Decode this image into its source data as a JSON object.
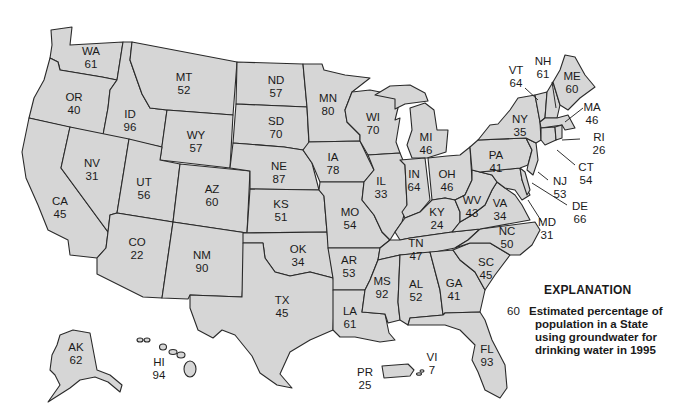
{
  "map": {
    "fill_color": "#d6d6d6",
    "stroke_color": "#2a2a2a",
    "states": [
      {
        "code": "WA",
        "value": "61"
      },
      {
        "code": "OR",
        "value": "40"
      },
      {
        "code": "CA",
        "value": "45"
      },
      {
        "code": "ID",
        "value": "96"
      },
      {
        "code": "NV",
        "value": "31"
      },
      {
        "code": "MT",
        "value": "52"
      },
      {
        "code": "WY",
        "value": "57"
      },
      {
        "code": "UT",
        "value": "56"
      },
      {
        "code": "AZ",
        "value": "60"
      },
      {
        "code": "CO",
        "value": "22"
      },
      {
        "code": "NM",
        "value": "90"
      },
      {
        "code": "ND",
        "value": "57"
      },
      {
        "code": "SD",
        "value": "70"
      },
      {
        "code": "NE",
        "value": "87"
      },
      {
        "code": "KS",
        "value": "51"
      },
      {
        "code": "OK",
        "value": "34"
      },
      {
        "code": "TX",
        "value": "45"
      },
      {
        "code": "MN",
        "value": "80"
      },
      {
        "code": "IA",
        "value": "78"
      },
      {
        "code": "MO",
        "value": "54"
      },
      {
        "code": "AR",
        "value": "53"
      },
      {
        "code": "LA",
        "value": "61"
      },
      {
        "code": "WI",
        "value": "70"
      },
      {
        "code": "IL",
        "value": "33"
      },
      {
        "code": "MI",
        "value": "46"
      },
      {
        "code": "IN",
        "value": "64"
      },
      {
        "code": "OH",
        "value": "46"
      },
      {
        "code": "KY",
        "value": "24"
      },
      {
        "code": "TN",
        "value": "47"
      },
      {
        "code": "MS",
        "value": "92"
      },
      {
        "code": "AL",
        "value": "52"
      },
      {
        "code": "GA",
        "value": "41"
      },
      {
        "code": "FL",
        "value": "93"
      },
      {
        "code": "SC",
        "value": "45"
      },
      {
        "code": "NC",
        "value": "50"
      },
      {
        "code": "VA",
        "value": "34"
      },
      {
        "code": "WV",
        "value": "43"
      },
      {
        "code": "PA",
        "value": "41"
      },
      {
        "code": "NY",
        "value": "35"
      },
      {
        "code": "VT",
        "value": "64"
      },
      {
        "code": "NH",
        "value": "61"
      },
      {
        "code": "ME",
        "value": "60"
      },
      {
        "code": "MA",
        "value": "46"
      },
      {
        "code": "RI",
        "value": "26"
      },
      {
        "code": "CT",
        "value": "54"
      },
      {
        "code": "NJ",
        "value": "53"
      },
      {
        "code": "DE",
        "value": "66"
      },
      {
        "code": "MD",
        "value": "31"
      },
      {
        "code": "AK",
        "value": "62"
      },
      {
        "code": "HI",
        "value": "94"
      },
      {
        "code": "PR",
        "value": "25"
      },
      {
        "code": "VI",
        "value": "7"
      }
    ]
  },
  "explanation": {
    "title": "EXPLANATION",
    "sample_value": "60",
    "lines": [
      "Estimated percentage of",
      "population in a State",
      "using groundwater for",
      "drinking water in 1995"
    ]
  }
}
